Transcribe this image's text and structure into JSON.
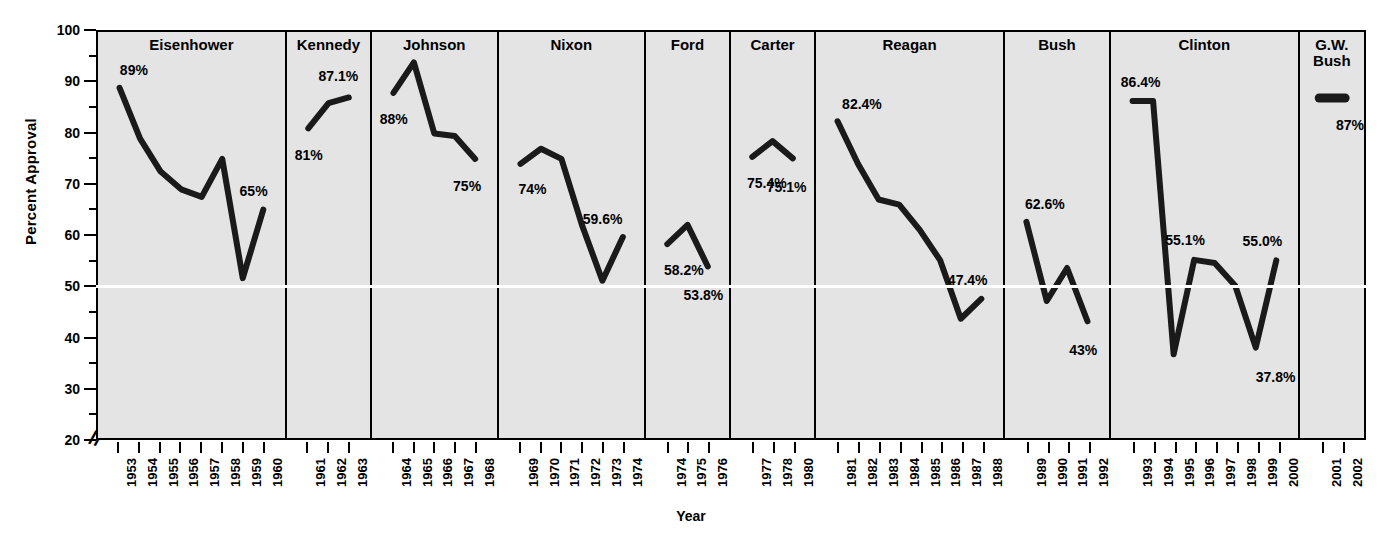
{
  "chart_data": {
    "type": "line",
    "title": "",
    "xlabel": "Year",
    "ylabel": "Percent Approval",
    "ylim": [
      20,
      100
    ],
    "y_ticks_major": [
      20,
      30,
      40,
      50,
      60,
      70,
      80,
      90,
      100
    ],
    "y_ticks_minor": [
      25,
      35,
      45,
      55,
      65,
      75,
      85,
      95
    ],
    "axis_break": true,
    "grid": false,
    "gridline_highlight": 50,
    "legend": "none",
    "x": [
      1953,
      1954,
      1955,
      1956,
      1957,
      1958,
      1959,
      1960,
      1961,
      1962,
      1963,
      1964,
      1965,
      1966,
      1967,
      1968,
      1969,
      1970,
      1971,
      1972,
      1973,
      1974,
      1974,
      1975,
      1976,
      1977,
      1978,
      1979,
      1980,
      1981,
      1982,
      1983,
      1984,
      1985,
      1986,
      1987,
      1988,
      1989,
      1990,
      1991,
      1992,
      1993,
      1994,
      1995,
      1996,
      1997,
      1998,
      1999,
      2000,
      2001,
      2002
    ],
    "panels": [
      {
        "name": "Eisenhower",
        "title": "Eisenhower",
        "years": [
          1953,
          1954,
          1955,
          1956,
          1957,
          1958,
          1959,
          1960
        ],
        "values": [
          89,
          79,
          72.5,
          69,
          67.5,
          75,
          51.5,
          65
        ],
        "labels": [
          {
            "text": "89%",
            "year": 1953,
            "value": 89,
            "dx": 14,
            "dy": -18
          },
          {
            "text": "65%",
            "year": 1960,
            "value": 65,
            "dx": -12,
            "dy": -20
          }
        ]
      },
      {
        "name": "Kennedy",
        "title": "Kennedy",
        "years": [
          1961,
          1962,
          1963
        ],
        "values": [
          81,
          86,
          87.1
        ],
        "labels": [
          {
            "text": "81%",
            "year": 1961,
            "value": 81,
            "dx": 0,
            "dy": 26
          },
          {
            "text": "87.1%",
            "year": 1963,
            "value": 87.1,
            "dx": -12,
            "dy": -22
          }
        ]
      },
      {
        "name": "Johnson",
        "title": "Johnson",
        "years": [
          1964,
          1965,
          1966,
          1967,
          1968
        ],
        "values": [
          88,
          94,
          80,
          79.5,
          75
        ],
        "labels": [
          {
            "text": "88%",
            "year": 1964,
            "value": 88,
            "dx": 0,
            "dy": 25
          },
          {
            "text": "75%",
            "year": 1968,
            "value": 75,
            "dx": -10,
            "dy": 26
          }
        ]
      },
      {
        "name": "Nixon",
        "title": "Nixon",
        "years": [
          1969,
          1970,
          1971,
          1972,
          1973,
          1974
        ],
        "values": [
          74,
          77,
          75,
          62,
          51,
          59.6
        ],
        "labels": [
          {
            "text": "74%",
            "year": 1969,
            "value": 74,
            "dx": 12,
            "dy": 24
          },
          {
            "text": "59.6%",
            "year": 1974,
            "value": 59.6,
            "dx": -22,
            "dy": -20
          }
        ]
      },
      {
        "name": "Ford",
        "title": "Ford",
        "years": [
          1974,
          1975,
          1976
        ],
        "values": [
          58.2,
          62,
          53.8
        ],
        "labels": [
          {
            "text": "58.2%",
            "year": 1974,
            "value": 58.2,
            "dx": 16,
            "dy": 24
          },
          {
            "text": "53.8%",
            "year": 1976,
            "value": 53.8,
            "dx": -6,
            "dy": 26
          }
        ]
      },
      {
        "name": "Carter",
        "title": "Carter",
        "years": [
          1977,
          1978,
          1980
        ],
        "values": [
          75.4,
          78.5,
          75.1
        ],
        "labels": [
          {
            "text": "75.4%",
            "year": 1977,
            "value": 75.4,
            "dx": 14,
            "dy": 25
          },
          {
            "text": "75.1%",
            "year": 1980,
            "value": 75.1,
            "dx": -8,
            "dy": 27
          }
        ]
      },
      {
        "name": "Reagan",
        "title": "Reagan",
        "years": [
          1981,
          1982,
          1983,
          1984,
          1985,
          1986,
          1987,
          1988
        ],
        "values": [
          82.4,
          74,
          67,
          66,
          61,
          55,
          43.5,
          47.4
        ],
        "labels": [
          {
            "text": "82.4%",
            "year": 1981,
            "value": 82.4,
            "dx": 24,
            "dy": -18
          },
          {
            "text": "47.4%",
            "year": 1988,
            "value": 47.4,
            "dx": -16,
            "dy": -22
          }
        ]
      },
      {
        "name": "Bush",
        "title": "Bush",
        "years": [
          1989,
          1990,
          1991,
          1992
        ],
        "values": [
          62.6,
          47,
          53.5,
          43
        ],
        "labels": [
          {
            "text": "62.6%",
            "year": 1989,
            "value": 62.6,
            "dx": 18,
            "dy": -20
          },
          {
            "text": "43%",
            "year": 1992,
            "value": 43,
            "dx": -6,
            "dy": 26
          }
        ]
      },
      {
        "name": "Clinton",
        "title": "Clinton",
        "years": [
          1993,
          1994,
          1995,
          1996,
          1997,
          1998,
          1999,
          2000
        ],
        "values": [
          86.4,
          86.4,
          36.5,
          55.1,
          54.5,
          50,
          37.8,
          55.0
        ],
        "labels": [
          {
            "text": "86.4%",
            "year": 1993,
            "value": 86.4,
            "dx": 8,
            "dy": -20
          },
          {
            "text": "55.1%",
            "year": 1996,
            "value": 55.1,
            "dx": -10,
            "dy": -22
          },
          {
            "text": "55.0%",
            "year": 2000,
            "value": 55.0,
            "dx": -16,
            "dy": -22
          },
          {
            "text": "37.8%",
            "year": 1999,
            "value": 37.8,
            "dx": 18,
            "dy": 26
          }
        ]
      },
      {
        "name": "G.W. Bush",
        "title": "G.W.\nBush",
        "years": [
          2001,
          2002
        ],
        "values": [
          87,
          87
        ],
        "marker_only": true,
        "labels": [
          {
            "text": "87%",
            "year": 2001,
            "value": 87,
            "dx": 18,
            "dy": 26
          }
        ]
      }
    ]
  },
  "axis": {
    "y_title": "Percent Approval",
    "x_title": "Year",
    "y_tick_labels": [
      "100",
      "90",
      "80",
      "70",
      "60",
      "50",
      "40",
      "30",
      "20"
    ],
    "break_glyph": "//"
  },
  "panel_titles": {
    "eisenhower": "Eisenhower",
    "kennedy": "Kennedy",
    "johnson": "Johnson",
    "nixon": "Nixon",
    "ford": "Ford",
    "carter": "Carter",
    "reagan": "Reagan",
    "bush": "Bush",
    "clinton": "Clinton",
    "gwbush_line1": "G.W.",
    "gwbush_line2": "Bush"
  },
  "colors": {
    "plot_background": "#e4e4e4",
    "line": "#1a1a1a",
    "axis": "#000000",
    "gridline_50": "#ffffff",
    "page_background": "#ffffff"
  }
}
